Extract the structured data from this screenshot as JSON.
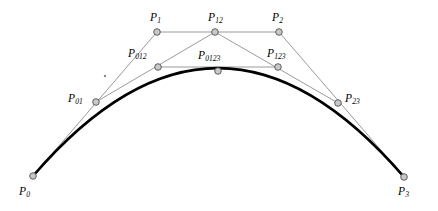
{
  "figure": {
    "width": 438,
    "height": 211,
    "background": "#ffffff",
    "style": {
      "hull_line_color": "#808080",
      "hull_line_width": 0.8,
      "curve_color": "#000000",
      "curve_width": 2.6,
      "node_fill": "#c8c8c8",
      "node_stroke": "#505050",
      "node_radius": 3.3,
      "label_color": "#000000"
    },
    "points": [
      {
        "id": "P0",
        "base": "P",
        "sub": "0",
        "x": 33,
        "y": 176,
        "label_x": 19,
        "label_y": 186,
        "node": true
      },
      {
        "id": "P1",
        "base": "P",
        "sub": "1",
        "x": 157,
        "y": 32,
        "label_x": 150,
        "label_y": 12,
        "node": true
      },
      {
        "id": "P2",
        "base": "P",
        "sub": "2",
        "x": 279,
        "y": 32,
        "label_x": 272,
        "label_y": 12,
        "node": true
      },
      {
        "id": "P3",
        "base": "P",
        "sub": "3",
        "x": 404,
        "y": 177,
        "label_x": 398,
        "label_y": 186,
        "node": true
      },
      {
        "id": "P01",
        "base": "P",
        "sub": "01",
        "x": 96,
        "y": 102,
        "label_x": 68,
        "label_y": 93,
        "node": true
      },
      {
        "id": "P12",
        "base": "P",
        "sub": "12",
        "x": 215,
        "y": 32,
        "label_x": 208,
        "label_y": 12,
        "node": true
      },
      {
        "id": "P23",
        "base": "P",
        "sub": "23",
        "x": 338,
        "y": 103,
        "label_x": 345,
        "label_y": 93,
        "node": true
      },
      {
        "id": "P012",
        "base": "P",
        "sub": "012",
        "x": 158,
        "y": 67,
        "label_x": 128,
        "label_y": 48,
        "node": true
      },
      {
        "id": "P123",
        "base": "P",
        "sub": "123",
        "x": 278,
        "y": 67,
        "label_x": 267,
        "label_y": 48,
        "node": true
      },
      {
        "id": "P0123",
        "base": "P",
        "sub": "0123",
        "x": 218,
        "y": 71,
        "label_x": 198,
        "label_y": 50,
        "node": true
      }
    ],
    "hull_segments": [
      {
        "name": "P0-P1",
        "from": "P0",
        "to": "P1"
      },
      {
        "name": "P1-P2",
        "from": "P1",
        "to": "P2"
      },
      {
        "name": "P2-P3",
        "from": "P2",
        "to": "P3"
      },
      {
        "name": "P01-P12",
        "from": "P01",
        "to": "P12"
      },
      {
        "name": "P12-P23",
        "from": "P12",
        "to": "P23"
      },
      {
        "name": "P012-P123",
        "from": "P012",
        "to": "P123"
      }
    ],
    "curve": {
      "name": "cubic-bezier-curve",
      "start": "P0",
      "control1": {
        "x": 157,
        "y": 32
      },
      "control2": {
        "x": 279,
        "y": 32
      },
      "end": "P3"
    },
    "stray_mark": {
      "x": 105,
      "y": 76,
      "size": 1.2
    }
  }
}
